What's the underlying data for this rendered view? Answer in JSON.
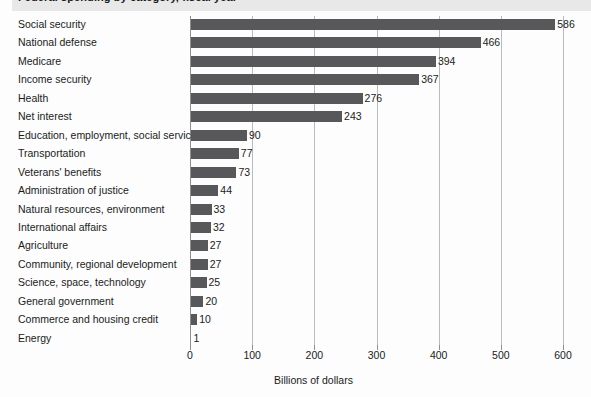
{
  "figure": {
    "title_clipped": "Federal spending by category, fiscal year",
    "banner_note": "title-clipped-at-top"
  },
  "chart_data": {
    "type": "bar",
    "orientation": "horizontal",
    "title": "",
    "xlabel": "Billions of dollars",
    "ylabel": "",
    "xlim": [
      0,
      600
    ],
    "xticks": [
      0,
      100,
      200,
      300,
      400,
      500,
      600
    ],
    "xtick_labels": [
      "0",
      "100",
      "200",
      "300",
      "400",
      "500",
      "600"
    ],
    "grid": "vertical-gridlines-at-xticks",
    "legend": "none",
    "bar_color": "#58585a",
    "gridline_color": "#b9bbbe",
    "categories": [
      "Social security",
      "National defense",
      "Medicare",
      "Income security",
      "Health",
      "Net interest",
      "Education, employment, social services",
      "Transportation",
      "Veterans' benefits",
      "Administration of justice",
      "Natural resources, environment",
      "International affairs",
      "Agriculture",
      "Community, regional development",
      "Science, space, technology",
      "General government",
      "Commerce and housing credit",
      "Energy"
    ],
    "values": [
      586,
      466,
      394,
      367,
      276,
      243,
      90,
      77,
      73,
      44,
      33,
      32,
      27,
      27,
      25,
      20,
      10,
      1
    ],
    "value_labels": [
      "586",
      "466",
      "394",
      "367",
      "276",
      "243",
      "90",
      "77",
      "73",
      "44",
      "33",
      "32",
      "27",
      "27",
      "25",
      "20",
      "10",
      "1"
    ]
  }
}
